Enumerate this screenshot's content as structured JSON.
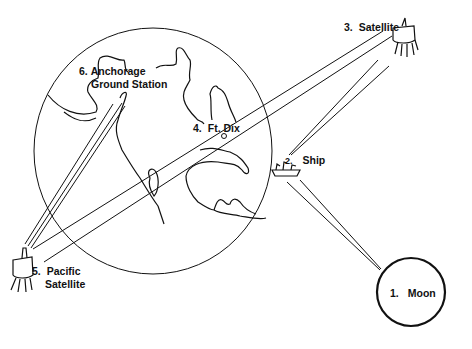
{
  "diagram": {
    "colors": {
      "ink": "#111111",
      "background": "#ffffff"
    },
    "nodes": [
      {
        "id": 1,
        "number": "1.",
        "label": "Moon",
        "icon": "moon-circle"
      },
      {
        "id": 2,
        "number": "2.",
        "label": "Ship",
        "icon": "ship-icon"
      },
      {
        "id": 3,
        "number": "3.",
        "label": "Satellite",
        "icon": "satellite-icon"
      },
      {
        "id": 4,
        "number": "4.",
        "label": "Ft. Dix",
        "icon": "ground-station-dot"
      },
      {
        "id": 5,
        "number": "5.",
        "label_line1": "Pacific",
        "label_line2": "Satellite",
        "icon": "satellite-icon"
      },
      {
        "id": 6,
        "number": "6.",
        "label_line1": "Anchorage",
        "label_line2": "Ground Station",
        "icon": "ground-station-dot"
      }
    ],
    "links": [
      {
        "from": "Satellite",
        "to": "Pacific Satellite",
        "via": "Ft. Dix"
      },
      {
        "from": "Satellite",
        "to": "Ship"
      },
      {
        "from": "Ship",
        "to": "Moon"
      },
      {
        "from": "Pacific Satellite",
        "to": "Anchorage Ground Station"
      }
    ]
  }
}
